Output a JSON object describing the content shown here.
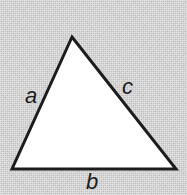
{
  "figure": {
    "name": "labeled-triangle-diagram",
    "background_color": "#c9c9c9",
    "fill_color": "#ffffff",
    "stroke_color": "#1c1c1c",
    "stroke_width": 3,
    "canvas": {
      "width": 187,
      "height": 195
    }
  },
  "shape": {
    "type": "triangle",
    "vertices": [
      {
        "name": "apex",
        "x": 72,
        "y": 37
      },
      {
        "name": "bottom-right",
        "x": 176,
        "y": 169
      },
      {
        "name": "bottom-left",
        "x": 12,
        "y": 169
      }
    ],
    "points_attr": "72,37 176,169 12,169"
  },
  "labels": {
    "left_side": {
      "text": "a",
      "side": "apex-to-bottom-left"
    },
    "bottom_side": {
      "text": "b",
      "side": "bottom-left-to-bottom-right"
    },
    "right_side": {
      "text": "c",
      "side": "apex-to-bottom-right"
    }
  }
}
